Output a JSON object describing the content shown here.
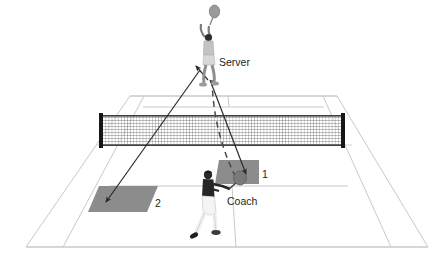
{
  "diagram": {
    "background_color": "#ffffff",
    "court_line_color": "#c9c9c9",
    "net_color": "#3a3a3a",
    "net_post_color": "#1a1a1a",
    "target_zone_color": "#8c8c8c",
    "arrow_color": "#2b2b2b",
    "figure_light_color": "#b4b4b4",
    "figure_dark_color": "#272727",
    "labels": {
      "server": "Server",
      "coach": "Coach",
      "zone_one": "1",
      "zone_two": "2"
    },
    "elements": {
      "server_figure": "server-player-figure",
      "coach_figure": "coach-player-figure",
      "net": "tennis-net",
      "zone_one_area": "target-zone-1",
      "zone_two_area": "target-zone-2",
      "arrow_to_zone_one": "solid-arrow-to-zone-1",
      "arrow_to_zone_two": "solid-arrow-to-zone-2",
      "feed_path": "dashed-feed-path",
      "arrow_to_server": "solid-arrow-to-server"
    }
  }
}
